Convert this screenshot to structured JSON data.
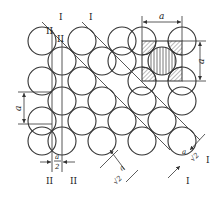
{
  "diagram": {
    "type": "circle-lattice",
    "stroke_color": "#333333",
    "hatch_color": "#555555",
    "circle_radius": 14,
    "lattice": {
      "rows_y": [
        41,
        61,
        81,
        101,
        121,
        141
      ],
      "even_row_x": [
        42,
        82,
        122,
        162,
        202
      ],
      "odd_row_x": [
        22,
        62,
        102,
        142,
        182
      ]
    },
    "labels": {
      "plane_I_top_left": "I",
      "plane_I_top_mid": "I",
      "plane_II_top_a": "II",
      "plane_II_top_b": "II",
      "plane_II_bottom_left": "II",
      "plane_II_bottom_right": "II",
      "plane_I_bottom_right_a": "I",
      "plane_I_bottom_right_b": "I",
      "dim_top": "a",
      "dim_right": "a",
      "dim_left": "a",
      "dim_half_num": "a",
      "dim_half_den": "2",
      "dim_diag_left_num": "a",
      "dim_diag_left_den": "√2",
      "dim_diag_right_num": "a",
      "dim_diag_right_den": "√2"
    },
    "unit_cell": {
      "label": "a",
      "highlighted": true,
      "center_circle": "vertically hatched",
      "corner_quarters": "diagonally hatched"
    }
  }
}
